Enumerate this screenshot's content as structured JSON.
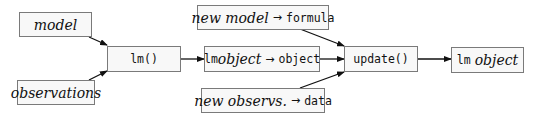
{
  "diagram": {
    "nodes": {
      "model": {
        "label": "model"
      },
      "observations": {
        "label": "observations"
      },
      "lm_call": {
        "label": "lm()"
      },
      "lm_object_to_object": {
        "mono_prefix": "lm",
        "italic": "object",
        "arrow": "→",
        "mono_suffix": "object"
      },
      "new_model_to_formula": {
        "italic": "new model",
        "arrow": "→",
        "mono_suffix": "formula"
      },
      "new_observs_to_data": {
        "italic": "new observs.",
        "arrow": "→",
        "mono_suffix": "data"
      },
      "update_call": {
        "label": "update()"
      },
      "lm_object_result": {
        "mono_prefix": "lm",
        "italic": "object"
      }
    },
    "edges": [
      {
        "from": "model",
        "to": "lm_call"
      },
      {
        "from": "observations",
        "to": "lm_call"
      },
      {
        "from": "lm_call",
        "to": "lm_object_to_object"
      },
      {
        "from": "lm_object_to_object",
        "to": "update_call"
      },
      {
        "from": "new_model_to_formula",
        "to": "update_call"
      },
      {
        "from": "new_observs_to_data",
        "to": "update_call"
      },
      {
        "from": "update_call",
        "to": "lm_object_result"
      }
    ],
    "colors": {
      "border": "#7a7a7a",
      "fill": "#f8f8f8",
      "edge": "#111111"
    }
  }
}
